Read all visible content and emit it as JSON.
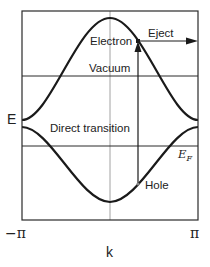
{
  "diagram": {
    "type": "band-structure",
    "axes": {
      "y_label": "E",
      "x_label": "k",
      "x_ticks": [
        "−π",
        "π"
      ]
    },
    "levels": {
      "vacuum": "Vacuum",
      "fermi_main": "E",
      "fermi_sub": "F"
    },
    "annotations": {
      "electron": "Electron",
      "eject": "Eject",
      "direct_transition": "Direct transition",
      "hole": "Hole"
    },
    "colors": {
      "curve": "#1a1a1a",
      "frame": "#2a2a2a",
      "guide": "#8a8a8a",
      "text": "#222222"
    }
  }
}
